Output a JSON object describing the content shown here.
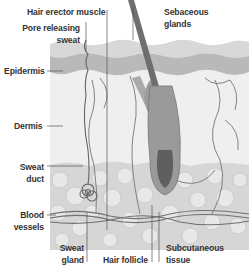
{
  "diagram": {
    "type": "anatomical cross-section",
    "palette": {
      "background": "#ffffff",
      "epidermis_outer": "#d8d8d8",
      "epidermis_inner": "#b9b9b9",
      "dermis": "#efefef",
      "subcutaneous": "#d4d4d4",
      "hair": "#7a7a7a",
      "label_text": "#333333",
      "leader_line": "#555555"
    },
    "labels": {
      "hair_erector_muscle": "Hair erector muscle",
      "pore_line1": "Pore releasing",
      "pore_line2": "sweat",
      "sebaceous_line1": "Sebaceous",
      "sebaceous_line2": "glands",
      "epidermis": "Epidermis",
      "dermis": "Dermis",
      "sweat_duct_line1": "Sweat",
      "sweat_duct_line2": "duct",
      "blood_line1": "Blood",
      "blood_line2": "vessels",
      "sweat_gland_line1": "Sweat",
      "sweat_gland_line2": "gland",
      "hair_follicle": "Hair follicle",
      "subcutaneous_line1": "Subcutaneous",
      "subcutaneous_line2": "tissue"
    }
  }
}
